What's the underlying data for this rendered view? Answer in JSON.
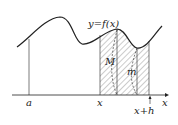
{
  "diagram": {
    "curve_label": "y=f(x)",
    "axis_label": "x",
    "tick_labels": {
      "a": "a",
      "x": "x",
      "x_plus_h": "x+h"
    },
    "region_labels": {
      "max": "M",
      "min": "m"
    },
    "colors": {
      "line": "#222222",
      "hatch": "#999999"
    }
  }
}
